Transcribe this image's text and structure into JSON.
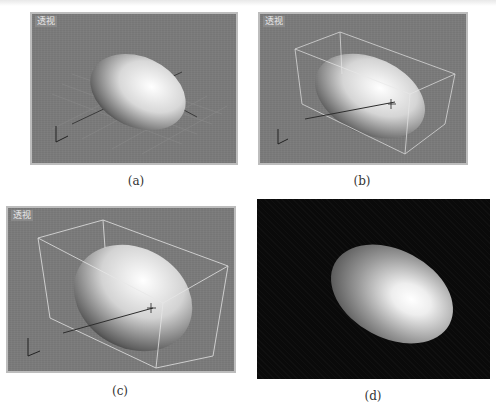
{
  "figure": {
    "panels": [
      {
        "id": "a",
        "type": "viewport",
        "viewport_label": "透视",
        "caption": "(a)",
        "state": "ellipsoid with grid, no selection"
      },
      {
        "id": "b",
        "type": "viewport",
        "viewport_label": "透视",
        "caption": "(b)",
        "state": "ellipsoid selected with bounding box"
      },
      {
        "id": "c",
        "type": "viewport",
        "viewport_label": "透视",
        "caption": "(c)",
        "state": "ellipsoid scaled up, selected"
      },
      {
        "id": "d",
        "type": "render",
        "caption": "(d)",
        "state": "rendered ellipsoid on black background"
      }
    ],
    "colors": {
      "viewport_bg": "#7b7b7b",
      "viewport_border": "#bdbdbd",
      "render_bg": "#0a0a0a",
      "selection_box": "#e8e8e8"
    }
  }
}
